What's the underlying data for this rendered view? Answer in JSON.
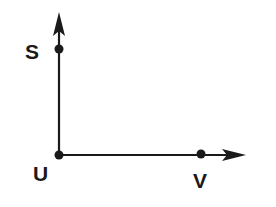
{
  "diagram": {
    "type": "coordinate-rays",
    "colors": {
      "stroke": "#1a1a1a",
      "background": "#ffffff"
    },
    "origin": {
      "name": "U",
      "x": 59,
      "y": 155
    },
    "rays": [
      {
        "id": "ray-US",
        "from": "U",
        "direction": "up",
        "tip": {
          "x": 59,
          "y": 12
        }
      },
      {
        "id": "ray-UV",
        "from": "U",
        "direction": "right",
        "tip": {
          "x": 246,
          "y": 155
        }
      }
    ],
    "points": [
      {
        "name": "S",
        "x": 59,
        "y": 49,
        "label": "S"
      },
      {
        "name": "U",
        "x": 59,
        "y": 155,
        "label": "U"
      },
      {
        "name": "V",
        "x": 201,
        "y": 154,
        "label": "V"
      }
    ]
  }
}
